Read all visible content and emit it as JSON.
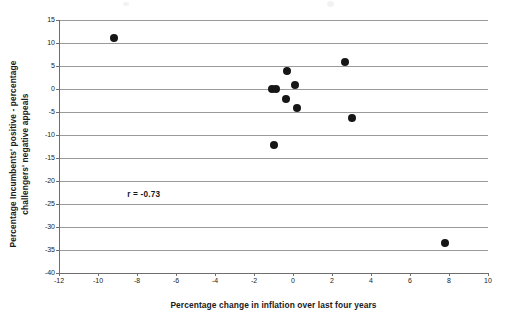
{
  "chart_data": {
    "type": "scatter",
    "title": "",
    "xlabel": "Percentage change in inflation over last four years",
    "ylabel": "Percentage Incumbents' positive - percentage challengers' negative appeals",
    "ylabel_lines": [
      "Percentage Incumbents' positive - percentage",
      "challengers' negative appeals"
    ],
    "xlim": [
      -12,
      10
    ],
    "ylim": [
      -40,
      15
    ],
    "xticks": [
      -12,
      -10,
      -8,
      -6,
      -4,
      -2,
      0,
      2,
      4,
      6,
      8,
      10
    ],
    "yticks": [
      15,
      10,
      5,
      0,
      -5,
      -10,
      -15,
      -20,
      -25,
      -30,
      -35,
      -40
    ],
    "xtick_labels": [
      "-12",
      "-10",
      "-8",
      "-6",
      "-4",
      "-2",
      "0",
      "2",
      "4",
      "6",
      "8",
      "10"
    ],
    "ytick_labels": [
      "15",
      "10",
      "5",
      "0",
      "-5",
      "-10",
      "-15",
      "-20",
      "-25",
      "-30",
      "-35",
      "-40"
    ],
    "grid": "horizontal",
    "legend": "none",
    "marker": "filled-circle",
    "marker_color": "#161616",
    "points": [
      {
        "x": -9.2,
        "y": 11.0
      },
      {
        "x": -1.1,
        "y": -0.1
      },
      {
        "x": -0.85,
        "y": -0.1
      },
      {
        "x": -0.3,
        "y": 3.9
      },
      {
        "x": 0.1,
        "y": 0.8
      },
      {
        "x": -0.35,
        "y": -2.1
      },
      {
        "x": 0.2,
        "y": -4.2
      },
      {
        "x": -1.0,
        "y": -12.2
      },
      {
        "x": 2.65,
        "y": 5.8
      },
      {
        "x": 3.0,
        "y": -6.2
      },
      {
        "x": 7.8,
        "y": -33.5
      }
    ],
    "annotations": [
      {
        "name": "correlation",
        "text": "r = -0.73",
        "x": -8.5,
        "y": -23.0
      }
    ]
  }
}
